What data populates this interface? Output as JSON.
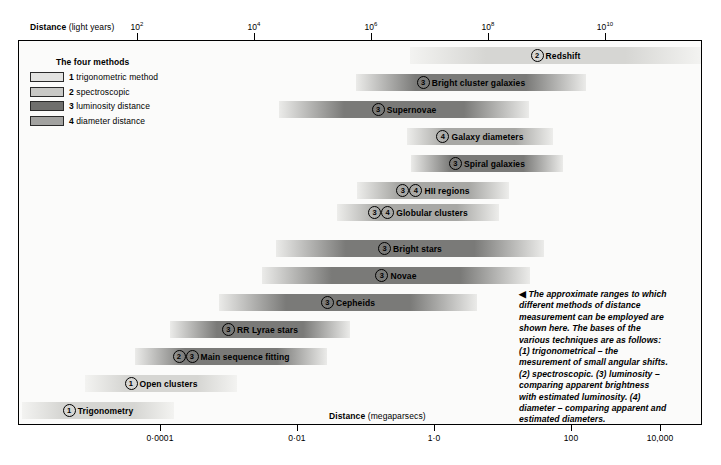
{
  "axes": {
    "top": {
      "title_bold": "Distance",
      "title_unit": " (light years)",
      "ticks": [
        {
          "label": "10",
          "exp": "2",
          "x": 137
        },
        {
          "label": "10",
          "exp": "4",
          "x": 254
        },
        {
          "label": "10",
          "exp": "6",
          "x": 371
        },
        {
          "label": "10",
          "exp": "8",
          "x": 488
        },
        {
          "label": "10",
          "exp": "10",
          "x": 605
        }
      ]
    },
    "bottom": {
      "title_bold": "Distance",
      "title_unit": " (megaparsecs)",
      "ticks": [
        {
          "label": "0·0001",
          "x": 160
        },
        {
          "label": "0·01",
          "x": 297
        },
        {
          "label": "1·0",
          "x": 434
        },
        {
          "label": "100",
          "x": 571
        },
        {
          "label": "10,000",
          "x": 660
        }
      ]
    }
  },
  "legend": {
    "title": "The four methods",
    "items": [
      {
        "num": "1",
        "label": "trigonometric method",
        "color": "#e3e3e1"
      },
      {
        "num": "2",
        "label": "spectroscopic",
        "color": "#c9c9c6"
      },
      {
        "num": "3",
        "label": "luminosity distance",
        "color": "#6f6f6d"
      },
      {
        "num": "4",
        "label": "diameter distance",
        "color": "#a2a2a0"
      }
    ]
  },
  "chart_data": {
    "type": "bar",
    "xlabel_top": "Distance (light years)",
    "xlabel_bottom": "Distance (megaparsecs)",
    "bars": [
      {
        "name": "Redshift",
        "methods": [
          "2"
        ],
        "x": 391,
        "width": 291,
        "y": 6,
        "shade": "light"
      },
      {
        "name": "Bright cluster galaxies",
        "methods": [
          "3"
        ],
        "x": 337,
        "width": 230,
        "y": 33,
        "shade": "dark"
      },
      {
        "name": "Supernovae",
        "methods": [
          "3"
        ],
        "x": 260,
        "width": 250,
        "y": 60,
        "shade": "dark"
      },
      {
        "name": "Galaxy diameters",
        "methods": [
          "4"
        ],
        "x": 388,
        "width": 146,
        "y": 87,
        "shade": "mid"
      },
      {
        "name": "Spiral galaxies",
        "methods": [
          "3"
        ],
        "x": 392,
        "width": 152,
        "y": 114,
        "shade": "dark"
      },
      {
        "name": "HII regions",
        "methods": [
          "3",
          "4"
        ],
        "x": 338,
        "width": 152,
        "y": 141,
        "shade": "mid"
      },
      {
        "name": "Globular clusters",
        "methods": [
          "3",
          "4"
        ],
        "x": 318,
        "width": 162,
        "y": 163,
        "shade": "mid"
      },
      {
        "name": "Bright stars",
        "methods": [
          "3"
        ],
        "x": 257,
        "width": 268,
        "y": 199,
        "shade": "dark"
      },
      {
        "name": "Novae",
        "methods": [
          "3"
        ],
        "x": 243,
        "width": 268,
        "y": 226,
        "shade": "dark"
      },
      {
        "name": "Cepheids",
        "methods": [
          "3"
        ],
        "x": 200,
        "width": 258,
        "y": 253,
        "shade": "dark"
      },
      {
        "name": "RR Lyrae stars",
        "methods": [
          "3"
        ],
        "x": 151,
        "width": 180,
        "y": 280,
        "shade": "dark"
      },
      {
        "name": "Main sequence fitting",
        "methods": [
          "2",
          "3"
        ],
        "x": 116,
        "width": 192,
        "y": 307,
        "shade": "dark"
      },
      {
        "name": "Open clusters",
        "methods": [
          "1"
        ],
        "x": 66,
        "width": 152,
        "y": 334,
        "shade": "light"
      },
      {
        "name": "Trigonometry",
        "methods": [
          "1"
        ],
        "x": 3,
        "width": 152,
        "y": 361,
        "shade": "light"
      }
    ]
  },
  "caption": {
    "marker": "◀",
    "text": "The approximate ranges to which different methods of distance measurement can be employed are shown here. The bases of the various techniques are as follows: (1) trigonometrical – the mesurement of small angular shifts. (2) spectroscopic. (3) luminosity – comparing apparent brightness with estimated luminosity. (4) diameter – comparing apparent and estimated diameters."
  }
}
